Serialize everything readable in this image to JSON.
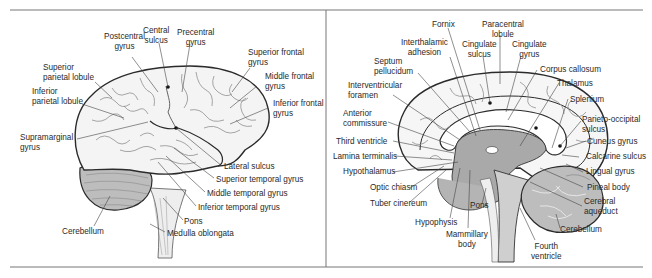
{
  "figure": {
    "panels": [
      {
        "id": "lateral",
        "view": "Lateral view of brain",
        "labels": {
          "postcentral_gyrus": "Postcentral\ngyrus",
          "central_sulcus": "Central\nsulcus",
          "precentral_gyrus": "Precentral\ngyrus",
          "superior_frontal_gyrus": "Superior frontal\ngyrus",
          "superior_parietal_lobule": "Superior\nparietal lobule",
          "middle_frontal_gyrus": "Middle frontal\ngyrus",
          "inferior_parietal_lobule": "Inferior\nparietal lobule",
          "inferior_frontal_gyrus": "Inferior frontal\ngyrus",
          "supramarginal_gyrus": "Supramarginal\ngyrus",
          "lateral_sulcus": "Lateral sulcus",
          "superior_temporal_gyrus": "Superior temporal gyrus",
          "middle_temporal_gyrus": "Middle temporal gyrus",
          "inferior_temporal_gyrus": "Inferior temporal gyrus",
          "pons": "Pons",
          "cerebellum": "Cerebellum",
          "medulla_oblongata": "Medulla oblongata"
        }
      },
      {
        "id": "midsagittal",
        "view": "Midsagittal view of brain",
        "labels": {
          "fornix": "Fornix",
          "paracentral_lobule": "Paracentral\nlobule",
          "interthalamic_adhesion": "Interthalamic\nadhesion",
          "cingulate_sulcus": "Cingulate\nsulcus",
          "cingulate_gyrus": "Cingulate\ngyrus",
          "septum_pellucidum": "Septum\npellucidum",
          "corpus_callosum": "Corpus callosum",
          "interventricular_foramen": "Interventricular\nforamen",
          "thalamus": "Thalamus",
          "splenium": "Splenium",
          "anterior_commissure": "Anterior\ncommissure",
          "parieto_occipital_sulcus": "Parieto-occipital\nsulcus",
          "third_ventricle": "Third ventricle",
          "cuneus_gyrus": "Cuneus gyrus",
          "lamina_terminalis": "Lamina terminalis",
          "calcarine_sulcus": "Calcarine sulcus",
          "hypothalamus": "Hypothalamus",
          "lingual_gyrus": "Lingual gyrus",
          "optic_chiasm": "Optic chiasm",
          "pineal_body": "Pineal body",
          "tuber_cinereum": "Tuber cinereum",
          "pons": "Pons",
          "cerebral_aqueduct": "Cerebral\naqueduct",
          "hypophysis": "Hypophysis",
          "cerebellum": "Cerebellum",
          "mammillary_body": "Mammillary\nbody",
          "fourth_ventricle": "Fourth\nventricle"
        }
      }
    ],
    "colors": {
      "outline": "#2b2b2b",
      "sulcus": "#8f8f8f",
      "leader": "#444444",
      "brain_fill": "#f4f4f4",
      "shaded": "#a9a9a9",
      "cerebellum_fill": "#bdbdbd",
      "frame": "#777777"
    }
  }
}
